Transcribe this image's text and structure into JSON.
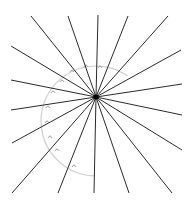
{
  "diagram": {
    "title": "",
    "center": [
      96,
      97
    ],
    "ray_color": "#2a2a2a",
    "arc_color": "#cfcfcf",
    "marker_color": "#8a8a8a",
    "rays": [
      [
        31,
        16
      ],
      [
        68,
        16
      ],
      [
        98,
        15
      ],
      [
        128,
        16
      ],
      [
        168,
        16
      ],
      [
        181,
        50
      ],
      [
        182,
        84
      ],
      [
        182,
        115
      ],
      [
        182,
        150
      ],
      [
        172,
        193
      ],
      [
        129,
        193
      ],
      [
        94,
        193
      ],
      [
        58,
        193
      ],
      [
        12,
        193
      ],
      [
        12,
        143
      ],
      [
        11,
        110
      ],
      [
        11,
        80
      ],
      [
        11,
        46
      ]
    ],
    "arc": {
      "cx": 96,
      "cy": 121,
      "r": 55,
      "start_deg": -55,
      "end_deg": 92
    },
    "angle_markers": [
      [
        72,
        71
      ],
      [
        86,
        66
      ],
      [
        100,
        67
      ],
      [
        62,
        81
      ],
      [
        53,
        92
      ],
      [
        48,
        107
      ],
      [
        47,
        122
      ],
      [
        50,
        137
      ],
      [
        57,
        150
      ],
      [
        74,
        166
      ]
    ]
  }
}
